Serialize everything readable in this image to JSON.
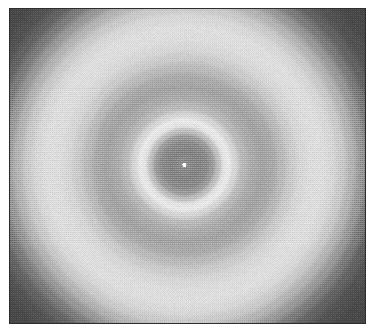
{
  "figure": {
    "kind": "grayscale-raster-image",
    "alt_text": "Grayscale radial interference pattern: a small bright central point inside a dark core, encircled by a narrow bright ring, a darker annulus, a broad bright halo, and dark corners.",
    "canvas": {
      "width": 374,
      "height": 333
    },
    "plate": {
      "left": 9,
      "top": 8,
      "width": 357,
      "height": 316,
      "border_color": "#2e2e2e",
      "border_width": 1,
      "page_background": "#ffffff"
    },
    "render": {
      "texture": "ordered-dither-halftone",
      "dither_amplitude": 11,
      "noise_amplitude": 5,
      "pixel_block": 1
    },
    "center": {
      "x_fraction": 0.49,
      "y_fraction": 0.495,
      "x_px": 185,
      "y_px": 164
    },
    "center_hotspot": {
      "label": "central-bright-point",
      "radius_px": 2,
      "color": "#ffffff"
    },
    "radial_profile": {
      "label": "Intensity vs radius (gray level 0-255)",
      "unit": "pixels from center",
      "stops": [
        {
          "r": 0,
          "gray": 255,
          "note": "central bright point"
        },
        {
          "r": 3,
          "gray": 141,
          "note": "dark core floor"
        },
        {
          "r": 14,
          "gray": 134
        },
        {
          "r": 22,
          "gray": 140
        },
        {
          "r": 28,
          "gray": 156
        },
        {
          "r": 34,
          "gray": 192
        },
        {
          "r": 40,
          "gray": 228,
          "note": "inner bright ring crest"
        },
        {
          "r": 44,
          "gray": 233,
          "note": "inner bright ring peak"
        },
        {
          "r": 50,
          "gray": 214
        },
        {
          "r": 58,
          "gray": 186
        },
        {
          "r": 68,
          "gray": 171
        },
        {
          "r": 78,
          "gray": 164,
          "note": "first dark annulus"
        },
        {
          "r": 88,
          "gray": 170
        },
        {
          "r": 98,
          "gray": 186
        },
        {
          "r": 108,
          "gray": 203
        },
        {
          "r": 118,
          "gray": 215
        },
        {
          "r": 128,
          "gray": 221
        },
        {
          "r": 138,
          "gray": 222,
          "note": "broad outer halo peak"
        },
        {
          "r": 148,
          "gray": 216
        },
        {
          "r": 158,
          "gray": 202
        },
        {
          "r": 168,
          "gray": 180
        },
        {
          "r": 178,
          "gray": 153
        },
        {
          "r": 188,
          "gray": 124
        },
        {
          "r": 198,
          "gray": 100
        },
        {
          "r": 210,
          "gray": 83
        },
        {
          "r": 225,
          "gray": 74
        },
        {
          "r": 245,
          "gray": 71,
          "note": "dark corner floor"
        },
        {
          "r": 300,
          "gray": 70
        }
      ]
    },
    "features": [
      {
        "name": "central-bright-point",
        "radius_px": 1,
        "gray": 255
      },
      {
        "name": "dark-core",
        "radius_px": 18,
        "gray": 136
      },
      {
        "name": "inner-bright-ring",
        "radius_px": 43,
        "gray": 233
      },
      {
        "name": "dark-annulus",
        "radius_px": 78,
        "gray": 164
      },
      {
        "name": "outer-bright-halo",
        "radius_px": 135,
        "gray": 222
      },
      {
        "name": "dark-corner-field",
        "radius_px": 240,
        "gray": 72
      }
    ],
    "palette": {
      "white": "#ffffff",
      "highlight": "#e9e9e9",
      "halo": "#dedede",
      "midtone": "#a4a4a4",
      "core": "#888888",
      "shadow": "#4a4a4a",
      "frame": "#2e2e2e"
    }
  }
}
